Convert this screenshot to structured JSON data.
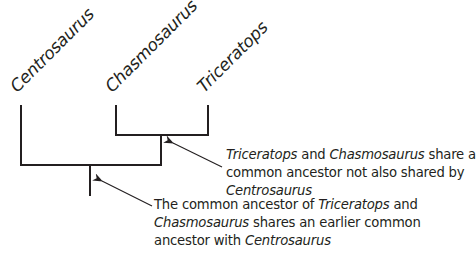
{
  "diagram": {
    "type": "cladogram",
    "taxa": [
      {
        "id": "centrosaurus",
        "label": "Centrosaurus"
      },
      {
        "id": "chasmosaurus",
        "label": "Chasmosaurus"
      },
      {
        "id": "triceratops",
        "label": "Triceratops"
      }
    ],
    "annotations": [
      {
        "id": "inner-node-note",
        "lines": [
          [
            {
              "t": "Triceratops",
              "i": true
            },
            {
              "t": " and ",
              "i": false
            },
            {
              "t": "Chasmosaurus",
              "i": true
            },
            {
              "t": " share a",
              "i": false
            }
          ],
          [
            {
              "t": "common ancestor not also shared by",
              "i": false
            }
          ],
          [
            {
              "t": "Centrosaurus",
              "i": true
            }
          ]
        ]
      },
      {
        "id": "root-node-note",
        "lines": [
          [
            {
              "t": "The common ancestor of ",
              "i": false
            },
            {
              "t": "Triceratops",
              "i": true
            },
            {
              "t": " and",
              "i": false
            }
          ],
          [
            {
              "t": "Chasmosaurus",
              "i": true
            },
            {
              "t": " shares an earlier common",
              "i": false
            }
          ],
          [
            {
              "t": "ancestor with ",
              "i": false
            },
            {
              "t": "Centrosaurus",
              "i": true
            }
          ]
        ]
      }
    ],
    "colors": {
      "line": "#231f20",
      "text": "#231f20",
      "background": "#ffffff"
    }
  }
}
